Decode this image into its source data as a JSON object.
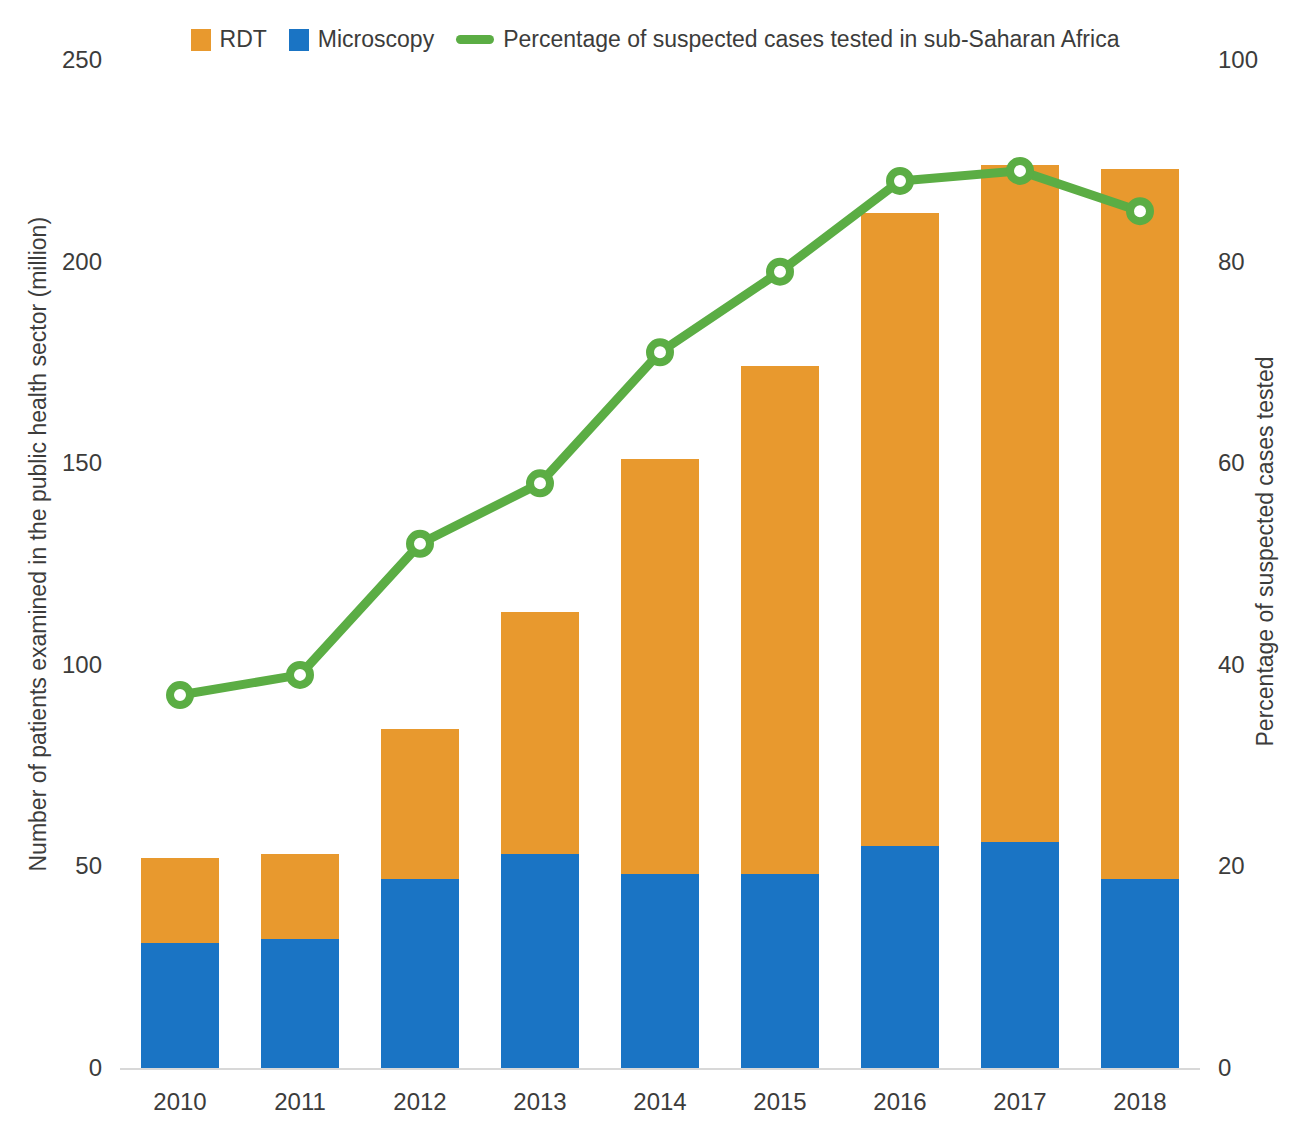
{
  "legend": {
    "items": [
      {
        "label": "RDT",
        "marker": "square-swatch",
        "color": "#E8992E"
      },
      {
        "label": "Microscopy",
        "marker": "square-swatch",
        "color": "#1A74C4"
      },
      {
        "label": "Percentage of suspected cases tested in sub-Saharan Africa",
        "marker": "line-swatch",
        "color": "#5BAD44"
      }
    ]
  },
  "axes": {
    "left_title": "Number of patients examined in the public health sector (million)",
    "right_title": "Percentage of suspected cases tested",
    "left_ticks": [
      "0",
      "50",
      "100",
      "150",
      "200",
      "250"
    ],
    "right_ticks": [
      "0",
      "20",
      "40",
      "60",
      "80",
      "100"
    ]
  },
  "chart_data": {
    "type": "bar",
    "title": "",
    "xlabel": "",
    "ylabel": "Number of patients examined in the public health sector (million)",
    "y2label": "Percentage of suspected cases tested",
    "ylim": [
      0,
      250
    ],
    "y2lim": [
      0,
      100
    ],
    "grid": false,
    "legend_position": "top-center",
    "categories": [
      "2010",
      "2011",
      "2012",
      "2013",
      "2014",
      "2015",
      "2016",
      "2017",
      "2018"
    ],
    "series": [
      {
        "name": "Microscopy",
        "type": "bar",
        "stack": "total",
        "axis": "left",
        "color": "#1A74C4",
        "values": [
          31,
          32,
          47,
          53,
          48,
          48,
          55,
          56,
          47
        ]
      },
      {
        "name": "RDT",
        "type": "bar",
        "stack": "total",
        "axis": "left",
        "color": "#E8992E",
        "values": [
          21,
          21,
          37,
          60,
          103,
          126,
          157,
          168,
          176
        ]
      },
      {
        "name": "Percentage of suspected cases tested in sub-Saharan Africa",
        "type": "line",
        "axis": "right",
        "color": "#5BAD44",
        "values": [
          37,
          39,
          52,
          58,
          71,
          79,
          88,
          89,
          85
        ]
      }
    ],
    "totals": [
      52,
      53,
      84,
      113,
      151,
      174,
      212,
      224,
      223
    ]
  }
}
